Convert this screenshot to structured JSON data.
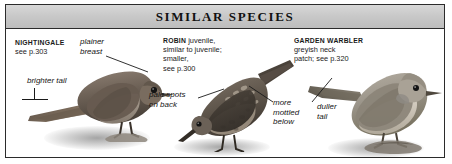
{
  "panel": {
    "header": {
      "title": "SIMILAR SPECIES"
    }
  },
  "species": [
    {
      "id": "nightingale",
      "name": "NIGHTINGALE",
      "reference": "see p.303",
      "callouts": [
        {
          "id": "plainer-breast",
          "text": "plainer\nbreast"
        },
        {
          "id": "brighter-tail",
          "text": "brighter tail"
        }
      ]
    },
    {
      "id": "robin-juvenile",
      "name": "ROBIN",
      "detail": " juvenile,\nsimilar to juvenile;\nsmaller,\nsee p.300",
      "callouts": [
        {
          "id": "pale-spots-on-back",
          "text": "pale spots\non back"
        },
        {
          "id": "more-mottled-below",
          "text": "more\nmottled\nbelow"
        }
      ]
    },
    {
      "id": "garden-warbler",
      "name": "GARDEN WARBLER",
      "reference": "greyish neck\npatch; see p.320",
      "callouts": [
        {
          "id": "duller-tail",
          "text": "duller\ntail"
        }
      ]
    }
  ],
  "colors": {
    "frame": "#2b2b2b",
    "header_band": "#c9c9c9",
    "text": "#1a1a1a",
    "nightingale_body": "#6e6257",
    "robin_body": "#6b6157",
    "warbler_body": "#9b958a"
  }
}
